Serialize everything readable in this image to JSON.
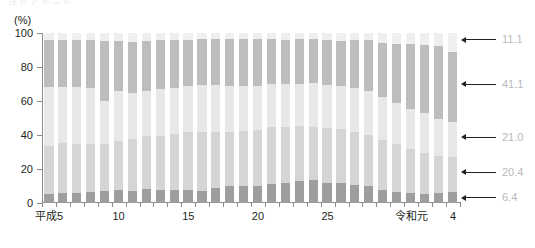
{
  "top_crop_text": "はなくなった",
  "axis": {
    "unit_label": "(%)",
    "y_ticks": [
      "100",
      "80",
      "60",
      "40",
      "20",
      "0"
    ],
    "y_min": 0,
    "y_max": 100,
    "x_tick_labels": [
      {
        "label": "平成5",
        "index": 0
      },
      {
        "label": "10",
        "index": 5
      },
      {
        "label": "15",
        "index": 10
      },
      {
        "label": "20",
        "index": 15
      },
      {
        "label": "25",
        "index": 20
      },
      {
        "label": "令和元",
        "index": 26
      },
      {
        "label": "4",
        "index": 29
      }
    ]
  },
  "annotations": [
    {
      "name": "annotation-11-1",
      "value": "11.1",
      "y_center": 96.0
    },
    {
      "name": "annotation-41-1",
      "value": "41.1",
      "y_center": 69.9
    },
    {
      "name": "annotation-21-0",
      "value": "21.0",
      "y_center": 38.8
    },
    {
      "name": "annotation-20-4",
      "value": "20.4",
      "y_center": 18.1
    },
    {
      "name": "annotation-6-4",
      "value": "6.4",
      "y_center": 3.2
    }
  ],
  "colors": {
    "segment_1": "#9e9e9e",
    "segment_2": "#d5d5d5",
    "segment_3": "#e8e8e8",
    "segment_4": "#bdbdbd",
    "segment_5": "#efefef",
    "axis": "#8c8c8c",
    "text": "#231f20",
    "annotation_text": "#b9b9bc",
    "arrow": "#231f20"
  },
  "chart_data": {
    "type": "bar",
    "stacked": true,
    "normalized_percent": true,
    "title": "",
    "xlabel": "",
    "ylabel": "(%)",
    "ylim": [
      0,
      100
    ],
    "grid": false,
    "legend_position": "none",
    "categories": [
      "平成5",
      "6",
      "7",
      "8",
      "9",
      "10",
      "11",
      "12",
      "13",
      "14",
      "15",
      "16",
      "17",
      "18",
      "19",
      "20",
      "21",
      "22",
      "23",
      "24",
      "25",
      "26",
      "27",
      "28",
      "29",
      "30",
      "令和元",
      "2",
      "3",
      "4"
    ],
    "series": [
      {
        "name": "segment_1_bottom",
        "color": "#9e9e9e",
        "values": [
          5.5,
          5.6,
          5.9,
          6.2,
          6.8,
          7.4,
          7.3,
          8.2,
          7.5,
          7.4,
          7.6,
          7.3,
          8.7,
          10.0,
          10.3,
          10.0,
          11.3,
          11.7,
          13.2,
          13.4,
          12.0,
          11.6,
          10.5,
          9.8,
          7.6,
          6.6,
          6.0,
          5.5,
          5.6,
          6.4
        ]
      },
      {
        "name": "segment_2",
        "color": "#d5d5d5",
        "values": [
          28.0,
          29.5,
          29.0,
          28.5,
          28.0,
          29.3,
          30.5,
          31.0,
          32.0,
          33.0,
          34.0,
          34.5,
          33.0,
          32.0,
          32.0,
          33.0,
          33.5,
          33.0,
          32.0,
          31.5,
          32.0,
          32.0,
          31.5,
          30.5,
          29.5,
          28.0,
          26.0,
          24.0,
          22.0,
          20.4
        ]
      },
      {
        "name": "segment_3",
        "color": "#e8e8e8",
        "values": [
          34.5,
          33.0,
          33.5,
          33.0,
          25.5,
          29.0,
          27.0,
          26.5,
          27.5,
          27.0,
          27.0,
          27.5,
          27.5,
          27.0,
          26.5,
          26.0,
          25.5,
          25.5,
          25.0,
          25.5,
          25.5,
          25.0,
          25.5,
          25.5,
          25.0,
          24.5,
          23.5,
          23.5,
          22.0,
          21.0
        ]
      },
      {
        "name": "segment_4",
        "color": "#bdbdbd",
        "values": [
          28.0,
          28.0,
          27.5,
          28.0,
          35.0,
          29.8,
          30.0,
          29.5,
          29.0,
          28.5,
          27.5,
          27.0,
          27.5,
          27.5,
          27.5,
          27.5,
          26.0,
          26.0,
          26.0,
          26.0,
          26.5,
          26.5,
          28.5,
          30.0,
          32.0,
          34.5,
          38.0,
          40.0,
          42.5,
          41.1
        ]
      },
      {
        "name": "segment_5_top",
        "color": "#efefef",
        "values": [
          4.0,
          3.9,
          4.1,
          4.3,
          4.7,
          4.5,
          5.2,
          4.8,
          4.0,
          4.1,
          3.9,
          3.7,
          3.3,
          3.5,
          3.7,
          3.5,
          3.7,
          3.8,
          3.8,
          3.6,
          4.0,
          4.9,
          4.0,
          4.2,
          5.9,
          6.4,
          6.5,
          7.0,
          7.9,
          11.1
        ]
      }
    ]
  }
}
